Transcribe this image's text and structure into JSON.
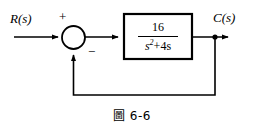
{
  "figure": {
    "caption": "圖 6-6",
    "background_color": "#ffffff",
    "line_color": "#000000"
  },
  "signals": {
    "input_label": "R(s)",
    "output_label": "C(s)"
  },
  "summing_junction": {
    "positive_sign": "+",
    "negative_sign": "−",
    "shape": "circle"
  },
  "transfer_function_block": {
    "numerator": "16",
    "denominator_base": "s",
    "denominator_exponent": "2",
    "denominator_rest": "+4s",
    "expression": "16/(s^2+4s)"
  },
  "feedback": {
    "type": "unity",
    "gain": "1"
  }
}
